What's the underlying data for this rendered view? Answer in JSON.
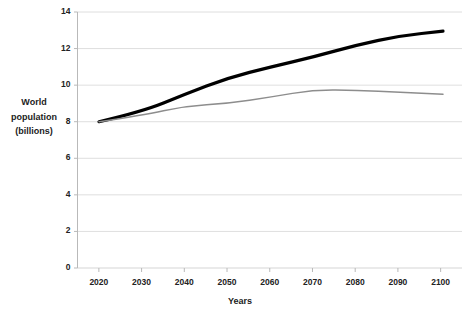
{
  "chart_data": {
    "type": "line",
    "title": "",
    "xlabel": "Years",
    "ylabel": "World population (billions)",
    "ylabel_lines": [
      "World",
      "population",
      "(billions)"
    ],
    "x": [
      2020,
      2030,
      2040,
      2050,
      2060,
      2070,
      2080,
      2090,
      2100
    ],
    "xlim": [
      2020,
      2100
    ],
    "ylim": [
      0,
      14
    ],
    "yticks": [
      0,
      2,
      4,
      6,
      8,
      10,
      12,
      14
    ],
    "ytick_labels": [
      "0",
      "2",
      "4",
      "6",
      "8",
      "10",
      "12",
      "14"
    ],
    "xtick_labels": [
      "2020",
      "2030",
      "2040",
      "2050",
      "2060",
      "2070",
      "2080",
      "2090",
      "2100"
    ],
    "grid": "horizontal",
    "legend": "none",
    "series": [
      {
        "name": "high-projection",
        "color": "#000000",
        "width": 3.2,
        "values": [
          8.0,
          8.55,
          9.5,
          10.4,
          11.0,
          11.55,
          12.2,
          12.7,
          12.95
        ]
      },
      {
        "name": "medium-projection",
        "color": "#8d8d8d",
        "width": 1.5,
        "values": [
          8.0,
          8.35,
          8.85,
          9.0,
          9.35,
          9.75,
          9.72,
          9.6,
          9.5
        ]
      }
    ]
  },
  "axes": {
    "y_title_lines": [
      "World",
      "population",
      "(billions)"
    ],
    "x_title": "Years",
    "y_labels": [
      "14",
      "12",
      "10",
      "8",
      "6",
      "4",
      "2",
      "0"
    ],
    "x_labels": [
      "2020",
      "2030",
      "2040",
      "2050",
      "2060",
      "2070",
      "2080",
      "2090",
      "2100"
    ]
  },
  "colors": {
    "series_high": "#000000",
    "series_medium": "#8d8d8d",
    "gridline": "#d5d5d5",
    "axis": "#b9b9b9",
    "text": "#222222",
    "background": "#ffffff"
  },
  "title_text": ""
}
